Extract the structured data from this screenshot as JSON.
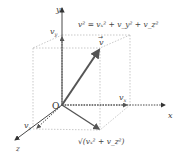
{
  "diagram": {
    "axes": {
      "x": "x",
      "y": "y",
      "z": "z",
      "origin": "O"
    },
    "components": {
      "vx": "v",
      "vy": "v",
      "vz": "v",
      "vx_sub": "x",
      "vy_sub": "y",
      "vz_sub": "z"
    },
    "vector_label": "v",
    "equation": "v² = vₓ² + v_y² + v_z²",
    "projection_label": "√(vₓ² + v_z²)",
    "colors": {
      "vector": "#555555",
      "axis": "#333333",
      "dotted": "#999999",
      "box": "#bbbbbb"
    }
  }
}
